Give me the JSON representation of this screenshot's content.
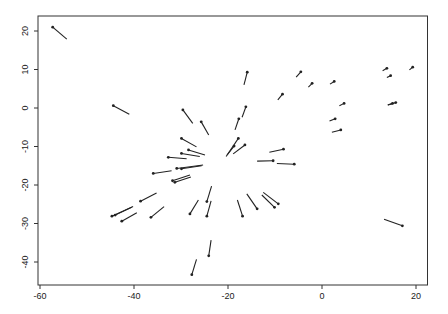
{
  "chart_data": {
    "type": "scatter",
    "subtype": "vector-segments",
    "title": "",
    "xlabel": "",
    "ylabel": "",
    "xlim": [
      -61,
      21.5
    ],
    "ylim": [
      -46.5,
      23.5
    ],
    "grid": false,
    "legend": null,
    "x_ticks": [
      -60,
      -40,
      -20,
      0,
      20
    ],
    "y_ticks": [
      20,
      10,
      0,
      -10,
      -20,
      -30,
      -40
    ],
    "x_tick_labels": [
      "-60",
      "-40",
      "-20",
      "0",
      "20"
    ],
    "y_tick_labels": [
      "20",
      "10",
      "0",
      "-10",
      "-20",
      "-30",
      "-40"
    ],
    "colors": {
      "line": "#222222",
      "axis": "#333333",
      "background": "#ffffff"
    },
    "segments": [
      {
        "x0": -57.3,
        "y0": 21.0,
        "x1": -54.3,
        "y1": 17.9
      },
      {
        "x0": -44.4,
        "y0": 0.6,
        "x1": -41.0,
        "y1": -1.6
      },
      {
        "x0": -4.5,
        "y0": 9.4,
        "x1": -5.5,
        "y1": 8.0
      },
      {
        "x0": -2.1,
        "y0": 6.4,
        "x1": -2.9,
        "y1": 5.4
      },
      {
        "x0": 2.6,
        "y0": 6.9,
        "x1": 1.7,
        "y1": 6.2
      },
      {
        "x0": -8.4,
        "y0": 3.6,
        "x1": -9.4,
        "y1": 2.1
      },
      {
        "x0": 4.7,
        "y0": 1.2,
        "x1": 3.7,
        "y1": 0.6
      },
      {
        "x0": 2.8,
        "y0": -2.8,
        "x1": 1.6,
        "y1": -3.4
      },
      {
        "x0": 4.0,
        "y0": -5.7,
        "x1": 2.1,
        "y1": -6.3
      },
      {
        "x0": 13.8,
        "y0": 10.3,
        "x1": 12.9,
        "y1": 9.7
      },
      {
        "x0": 14.6,
        "y0": 8.4,
        "x1": 13.8,
        "y1": 7.9
      },
      {
        "x0": 19.3,
        "y0": 10.6,
        "x1": 18.6,
        "y1": 9.9
      },
      {
        "x0": 15.7,
        "y0": 1.4,
        "x1": 14.0,
        "y1": 0.8
      },
      {
        "x0": 15.0,
        "y0": 1.2,
        "x1": 14.0,
        "y1": 0.8
      },
      {
        "x0": 17.1,
        "y0": -30.6,
        "x1": 13.2,
        "y1": -28.9
      },
      {
        "x0": -15.9,
        "y0": 9.3,
        "x1": -16.6,
        "y1": 6.0
      },
      {
        "x0": -16.2,
        "y0": 0.3,
        "x1": -17.0,
        "y1": -2.4
      },
      {
        "x0": -17.7,
        "y0": -2.8,
        "x1": -18.5,
        "y1": -5.7
      },
      {
        "x0": -29.6,
        "y0": -0.5,
        "x1": -27.5,
        "y1": -4.0
      },
      {
        "x0": -25.7,
        "y0": -3.6,
        "x1": -24.1,
        "y1": -7.0
      },
      {
        "x0": -29.9,
        "y0": -7.9,
        "x1": -26.7,
        "y1": -10.1
      },
      {
        "x0": -17.8,
        "y0": -7.9,
        "x1": -20.4,
        "y1": -12.6
      },
      {
        "x0": -16.4,
        "y0": -9.6,
        "x1": -18.9,
        "y1": -11.9
      },
      {
        "x0": -18.7,
        "y0": -9.9,
        "x1": -20.2,
        "y1": -12.2
      },
      {
        "x0": -28.4,
        "y0": -10.9,
        "x1": -24.9,
        "y1": -12.2
      },
      {
        "x0": -29.9,
        "y0": -11.8,
        "x1": -26.0,
        "y1": -12.6
      },
      {
        "x0": -32.7,
        "y0": -12.8,
        "x1": -28.8,
        "y1": -13.2
      },
      {
        "x0": -30.9,
        "y0": -15.7,
        "x1": -25.3,
        "y1": -14.8
      },
      {
        "x0": -29.9,
        "y0": -15.8,
        "x1": -25.6,
        "y1": -15.0
      },
      {
        "x0": -35.9,
        "y0": -17.0,
        "x1": -32.0,
        "y1": -16.3
      },
      {
        "x0": -31.8,
        "y0": -18.9,
        "x1": -28.1,
        "y1": -17.4
      },
      {
        "x0": -31.3,
        "y0": -19.3,
        "x1": -27.9,
        "y1": -17.9
      },
      {
        "x0": -8.2,
        "y0": -10.7,
        "x1": -11.2,
        "y1": -11.5
      },
      {
        "x0": -10.4,
        "y0": -13.7,
        "x1": -13.8,
        "y1": -13.8
      },
      {
        "x0": -5.9,
        "y0": -14.6,
        "x1": -9.6,
        "y1": -14.4
      },
      {
        "x0": -38.6,
        "y0": -24.2,
        "x1": -35.2,
        "y1": -22.1
      },
      {
        "x0": -44.7,
        "y0": -28.1,
        "x1": -40.5,
        "y1": -25.8
      },
      {
        "x0": -44.0,
        "y0": -27.8,
        "x1": -40.2,
        "y1": -25.6
      },
      {
        "x0": -42.6,
        "y0": -29.4,
        "x1": -39.4,
        "y1": -27.2
      },
      {
        "x0": -36.4,
        "y0": -28.4,
        "x1": -33.6,
        "y1": -25.6
      },
      {
        "x0": -28.1,
        "y0": -27.5,
        "x1": -26.3,
        "y1": -23.9
      },
      {
        "x0": -24.5,
        "y0": -24.3,
        "x1": -23.5,
        "y1": -20.3
      },
      {
        "x0": -24.5,
        "y0": -28.1,
        "x1": -23.6,
        "y1": -24.1
      },
      {
        "x0": -24.1,
        "y0": -38.4,
        "x1": -23.6,
        "y1": -34.3
      },
      {
        "x0": -27.7,
        "y0": -43.3,
        "x1": -26.7,
        "y1": -39.3
      },
      {
        "x0": -16.9,
        "y0": -28.1,
        "x1": -18.0,
        "y1": -23.9
      },
      {
        "x0": -13.8,
        "y0": -26.2,
        "x1": -16.0,
        "y1": -22.3
      },
      {
        "x0": -10.1,
        "y0": -25.8,
        "x1": -12.8,
        "y1": -22.6
      },
      {
        "x0": -9.3,
        "y0": -24.9,
        "x1": -12.5,
        "y1": -21.9
      }
    ]
  }
}
